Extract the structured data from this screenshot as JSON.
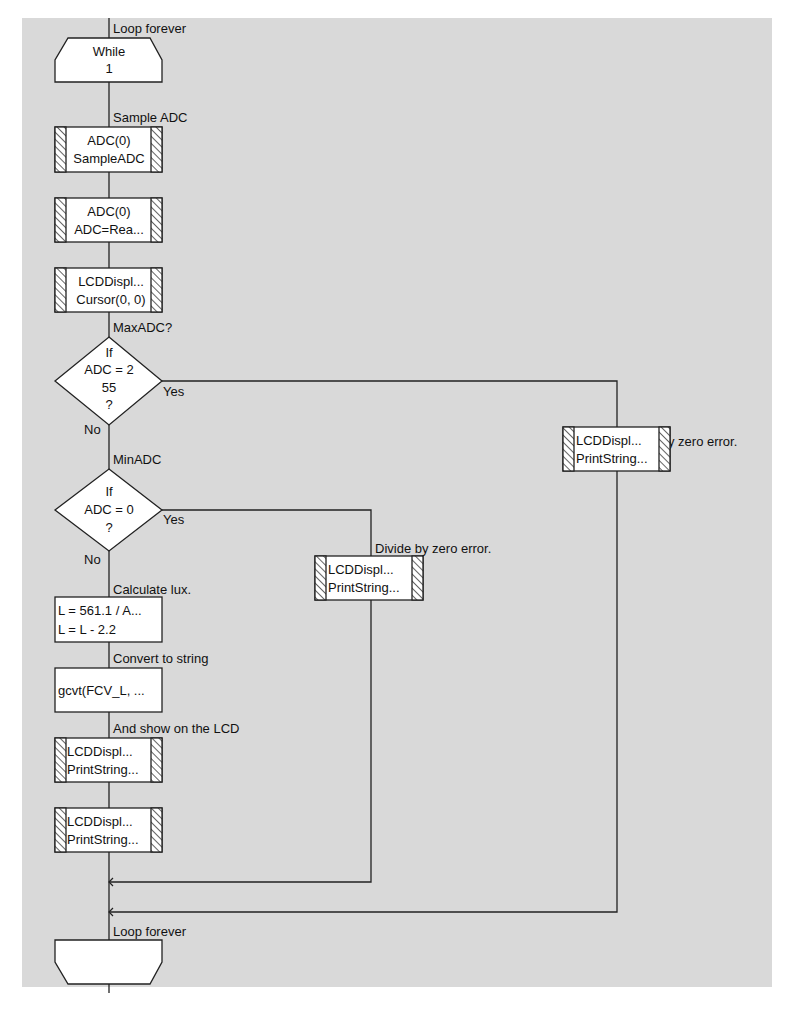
{
  "colors": {
    "background": "#d9d9d9",
    "page": "#ffffff",
    "line": "#222222",
    "box_fill": "#ffffff"
  },
  "loop_start": {
    "comment": "Loop forever",
    "line1": "While",
    "line2": "1"
  },
  "steps": [
    {
      "comment": "Sample ADC",
      "type": "component",
      "line1": "ADC(0)",
      "line2": "SampleADC"
    },
    {
      "comment": "",
      "type": "component",
      "line1": "ADC(0)",
      "line2": "ADC=Rea..."
    },
    {
      "comment": "",
      "type": "component",
      "line1": "LCDDispl...",
      "line2": "Cursor(0, 0)"
    }
  ],
  "decision1": {
    "comment": "MaxADC?",
    "line1": "If",
    "line2": "ADC = 2",
    "line3": "55",
    "line4": "?",
    "yes_label": "Yes",
    "no_label": "No",
    "yes_branch": {
      "comment": "Divide by zero error.",
      "line1": "LCDDispl...",
      "line2": "PrintString..."
    }
  },
  "decision2": {
    "comment": "MinADC",
    "line1": "If",
    "line2": "ADC = 0",
    "line3": "?",
    "yes_label": "Yes",
    "no_label": "No",
    "yes_branch": {
      "comment": "Divide by zero error.",
      "line1": "LCDDispl...",
      "line2": "PrintString..."
    }
  },
  "calc": {
    "comment": "Calculate lux.",
    "line1": "L = 561.1 / A...",
    "line2": "L = L - 2.2"
  },
  "convert": {
    "comment": "Convert to string",
    "line1": "gcvt(FCV_L, ..."
  },
  "show1": {
    "comment": "And show on the LCD",
    "line1": "LCDDispl...",
    "line2": "PrintString..."
  },
  "show2": {
    "comment": "",
    "line1": "LCDDispl...",
    "line2": "PrintString..."
  },
  "loop_end": {
    "comment": "Loop forever"
  }
}
